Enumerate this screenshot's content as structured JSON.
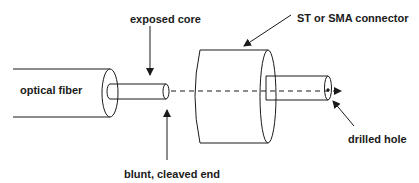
{
  "diagram": {
    "labels": {
      "optical_fiber": "optical fiber",
      "exposed_core": "exposed core",
      "connector": "ST or SMA connector",
      "drilled_hole": "drilled hole",
      "cleaved_end": "blunt, cleaved end"
    },
    "colors": {
      "stroke": "#1a1a1a",
      "background": "#ffffff"
    }
  }
}
